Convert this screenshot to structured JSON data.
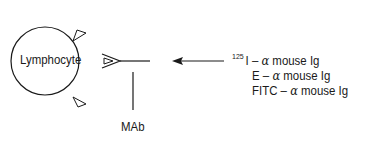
{
  "diagram": {
    "cell_label": "Lymphocyte",
    "antibody_label": "MAb",
    "reagents": [
      {
        "superscript": "125",
        "prefix": "I",
        "dash": "–",
        "alpha": "α",
        "suffix": "mouse Ig"
      },
      {
        "superscript": "",
        "prefix": "E",
        "dash": "–",
        "alpha": "α",
        "suffix": "mouse Ig"
      },
      {
        "superscript": "",
        "prefix": "FITC",
        "dash": "–",
        "alpha": "α",
        "suffix": "mouse Ig"
      }
    ],
    "colors": {
      "stroke": "#1a1a1a",
      "background": "#ffffff"
    }
  }
}
